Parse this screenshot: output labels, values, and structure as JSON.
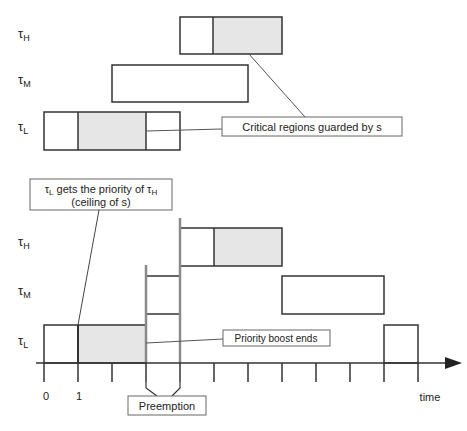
{
  "colors": {
    "stroke": "#333333",
    "shade": "#e6e6e6",
    "bar": "#8a8a8a",
    "box_border": "#555555"
  },
  "top_diagram": {
    "rows": [
      {
        "task": "τ",
        "sub": "H"
      },
      {
        "task": "τ",
        "sub": "M"
      },
      {
        "task": "τ",
        "sub": "L"
      }
    ],
    "jobs": [
      {
        "row": 0,
        "start": 4,
        "end": 7,
        "critical": [
          5,
          7
        ]
      },
      {
        "row": 1,
        "start": 2,
        "end": 6,
        "critical": null
      },
      {
        "row": 2,
        "start": -1,
        "end": 3,
        "critical": [
          0,
          2
        ]
      }
    ],
    "callout": "Critical regions guarded by s"
  },
  "bottom_diagram": {
    "rows": [
      {
        "task": "τ",
        "sub": "H"
      },
      {
        "task": "τ",
        "sub": "M"
      },
      {
        "task": "τ",
        "sub": "L"
      }
    ],
    "callout_top_line1_a": "τ",
    "callout_top_line1_sub1": "L",
    "callout_top_line1_b": " gets the priority of τ",
    "callout_top_line1_sub2": "H",
    "callout_top_line2": "(ceiling of s)",
    "callout_boost": "Priority boost ends",
    "callout_preemption": "Preemption",
    "axis_ticks": [
      "0",
      "1"
    ],
    "axis_label": "time"
  }
}
